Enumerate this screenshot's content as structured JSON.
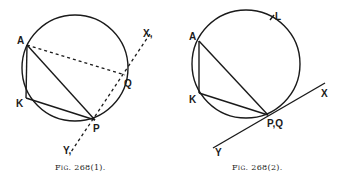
{
  "figures": [
    {
      "caption": "Fig. 268(1).",
      "labels": {
        "A": "A",
        "K": "K",
        "P": "P",
        "Q": "Q",
        "X": "X,",
        "Y": "Y,"
      },
      "description": "Circle with inscribed triangle AKP; dashed chord AQ and dashed line X-Q-P-Y"
    },
    {
      "caption": "Fig. 268(2).",
      "labels": {
        "A": "A",
        "K": "K",
        "PQ": "P,Q",
        "L": "L",
        "X": "X",
        "Y": "Y"
      },
      "description": "Circle with inscribed triangle AKP; solid tangent line XY touching the circle at P,Q; point L on the circle"
    }
  ]
}
